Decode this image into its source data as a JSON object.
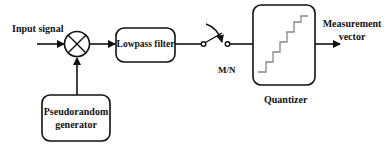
{
  "diagram": {
    "type": "block-diagram",
    "input_label": "Input signal",
    "blocks": {
      "mixer": {
        "symbol": "multiplier-circle-x"
      },
      "lowpass": {
        "label": "Lowpass filter"
      },
      "switch": {
        "label": "M/N"
      },
      "quantizer": {
        "label": "Quantizer"
      },
      "prng": {
        "label_line1": "Pseudorandom",
        "label_line2": "generator"
      }
    },
    "output_label_line1": "Measurement",
    "output_label_line2": "vector",
    "colors": {
      "stroke": "#111111",
      "background": "#ffffff"
    }
  }
}
